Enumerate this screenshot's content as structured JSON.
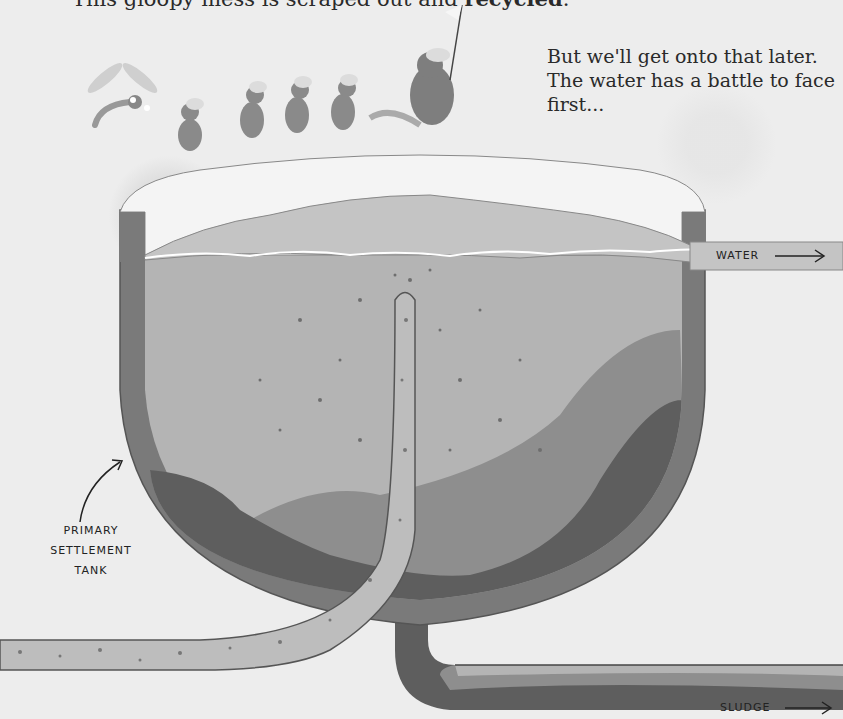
{
  "intro": {
    "line_prefix": "This gloopy mess is scraped out and ",
    "line_bold": "recycled",
    "line_suffix": "."
  },
  "caption": {
    "text": "But we'll get onto that later. The water has a battle to face first..."
  },
  "labels": {
    "tank": [
      "PRIMARY",
      "SETTLEMENT",
      "TANK"
    ],
    "water_outlet": "WATER",
    "sludge_outlet": "SLUDGE"
  },
  "illustration": {
    "characters": [
      "dragonfly",
      "mouse",
      "mouse",
      "mouse",
      "mouse",
      "rat-leader-with-flag"
    ],
    "colors": {
      "background": "#ececec",
      "tank_wall": "#7a7a7a",
      "tank_lid": "#f4f4f4",
      "water_surface": "#c4c4c4",
      "settled_water": "#b4b4b4",
      "sediment_light": "#8e8e8e",
      "sludge_dark": "#5e5e5e",
      "inlet_pipe": "#bdbdbd",
      "outline": "#555555"
    }
  }
}
